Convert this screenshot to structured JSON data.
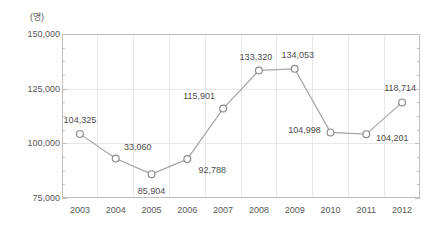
{
  "chart_data": {
    "type": "line",
    "title": "",
    "subtitle": "",
    "unit_label": "(명)",
    "xlabel": "",
    "ylabel": "",
    "categories": [
      "2003",
      "2004",
      "2005",
      "2006",
      "2007",
      "2008",
      "2009",
      "2010",
      "2011",
      "2012"
    ],
    "series": [
      {
        "name": "인원",
        "values": [
          104325,
          93060,
          85904,
          92788,
          115901,
          133320,
          134053,
          104998,
          104201,
          118714
        ],
        "point_labels": [
          "104,325",
          "33,060",
          "85,904",
          "92,788",
          "115,901",
          "133,320",
          "134,053",
          "104,998",
          "104,201",
          "118,714"
        ],
        "marker": "open-circle",
        "line_color": "#a6a6a6",
        "marker_edge_color": "#8c8c8c",
        "marker_face_color": "#ffffff"
      }
    ],
    "ylim": [
      75000,
      150000
    ],
    "yticks": [
      75000,
      100000,
      125000,
      150000
    ],
    "ytick_labels": [
      "75,000",
      "100,000",
      "125,000",
      "150,000"
    ],
    "yminor_step": 6250,
    "grid": {
      "vertical": true,
      "horizontal": true,
      "color": "#e8e8e8"
    },
    "axis_color": "#bfbfbf",
    "legend": {
      "visible": false,
      "position": "none"
    },
    "label_positions": [
      {
        "label": "104,325",
        "dx": 0,
        "dy": -14
      },
      {
        "label": "33,060",
        "dx": 22,
        "dy": -12
      },
      {
        "label": "85,904",
        "dx": 0,
        "dy": 17
      },
      {
        "label": "92,788",
        "dx": 25,
        "dy": 11
      },
      {
        "label": "115,901",
        "dx": -24,
        "dy": -13
      },
      {
        "label": "133,320",
        "dx": -3,
        "dy": -14
      },
      {
        "label": "134,053",
        "dx": 3,
        "dy": -14
      },
      {
        "label": "104,998",
        "dx": -26,
        "dy": -2
      },
      {
        "label": "104,201",
        "dx": 26,
        "dy": 4
      },
      {
        "label": "118,714",
        "dx": -2,
        "dy": -14
      }
    ]
  }
}
